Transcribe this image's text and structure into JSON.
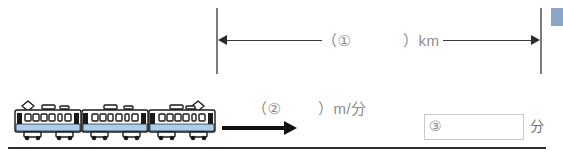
{
  "diagram": {
    "distance_bar": {
      "blank_open": "（①",
      "blank_close": "）km",
      "arrow_left_name": "left-arrowhead",
      "arrow_right_name": "right-arrowhead"
    },
    "speed": {
      "blank_open": "（②",
      "blank_close": "）m/分"
    },
    "answer": {
      "number_label": "③",
      "unit_label": "分",
      "input_value": "",
      "input_placeholder": ""
    },
    "train": {
      "car_count": 3,
      "body_color": "#ffffff",
      "stripe_color": "#aecde8",
      "outline_color": "#1a1a1a"
    },
    "colors": {
      "ground": "#2f2f2f",
      "tick": "#7b7b7b",
      "measure_line": "#3a3a3a",
      "blank_text": "#8c8c8c",
      "answer_border": "#c9c9c9",
      "marker_blue": "#8ba6c9"
    }
  }
}
